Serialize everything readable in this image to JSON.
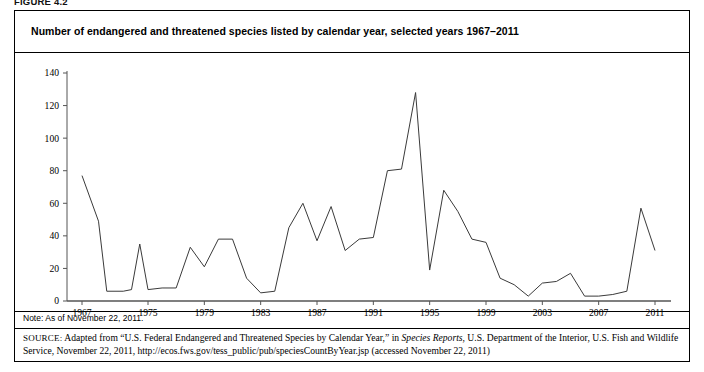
{
  "figure": {
    "label": "FIGURE 4.2",
    "title": "Number of endangered and threatened species listed by calendar year, selected years 1967–2011",
    "note": "Note: As of November 22, 2011.",
    "source_prefix": "SOURCE:",
    "source_part1": " Adapted from “U.S. Federal Endangered and Threatened Species by Calendar Year,” in ",
    "source_italic": "Species Reports",
    "source_part2": ", U.S. Department of the Interior, U.S. Fish and Wildlife Service, November 22, 2011, http://ecos.fws.gov/tess_public/pub/speciesCountByYear.jsp (accessed November 22, 2011)",
    "border_color": "#000000",
    "line_color": "#3a3a3a",
    "background": "#ffffff"
  },
  "chart_data": {
    "type": "line",
    "title": "Number of endangered and threatened species listed by calendar year, selected years 1967–2011",
    "xlabel": "",
    "ylabel": "",
    "ylim": [
      0,
      140
    ],
    "yticks": [
      0,
      20,
      40,
      60,
      80,
      100,
      120,
      140
    ],
    "xticks": [
      1967,
      1975,
      1979,
      1983,
      1987,
      1991,
      1995,
      1999,
      2003,
      2007,
      2011
    ],
    "grid": false,
    "legend": false,
    "x": [
      1967,
      1969,
      1970,
      1972,
      1973,
      1974,
      1975,
      1976,
      1977,
      1978,
      1979,
      1980,
      1981,
      1982,
      1983,
      1984,
      1985,
      1986,
      1987,
      1988,
      1989,
      1990,
      1991,
      1992,
      1993,
      1994,
      1995,
      1996,
      1997,
      1998,
      1999,
      2000,
      2001,
      2002,
      2003,
      2004,
      2005,
      2006,
      2007,
      2008,
      2009,
      2010,
      2011
    ],
    "values": [
      77,
      49,
      6,
      6,
      7,
      35,
      7,
      8,
      8,
      33,
      21,
      38,
      38,
      14,
      5,
      6,
      45,
      60,
      37,
      58,
      31,
      38,
      39,
      80,
      81,
      128,
      19,
      68,
      55,
      38,
      36,
      14,
      10,
      3,
      11,
      12,
      17,
      3,
      3,
      4,
      6,
      57,
      31
    ],
    "annotations": [
      {
        "year": 1994,
        "value": 128,
        "note": "peak"
      },
      {
        "year": 1995,
        "value": 19,
        "note": "sharp drop"
      },
      {
        "year": 2010,
        "value": 57,
        "note": "late spike"
      }
    ]
  }
}
